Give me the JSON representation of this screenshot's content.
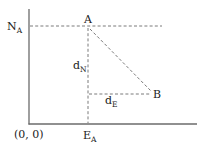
{
  "diagram": {
    "type": "coordinate-displacement",
    "origin_label": "(0, 0)",
    "colors": {
      "axis": "#6b6b6b",
      "dashed": "#7a7a7a",
      "text": "#222222",
      "background": "#ffffff"
    },
    "points": {
      "A": {
        "label": "A"
      },
      "B": {
        "label": "B"
      }
    },
    "axis_labels": {
      "north": {
        "main": "N",
        "sub": "A"
      },
      "east": {
        "main": "E",
        "sub": "A"
      }
    },
    "distances": {
      "north": {
        "main": "d",
        "sub": "N"
      },
      "east": {
        "main": "d",
        "sub": "E"
      }
    }
  }
}
